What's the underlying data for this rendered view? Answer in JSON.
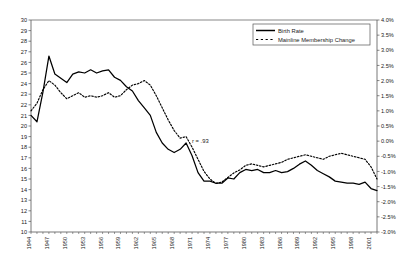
{
  "chart_data": {
    "type": "line",
    "title": "",
    "subtitle": "",
    "xlabel": "",
    "ylabel": "",
    "grid": false,
    "legend_position": "top-right",
    "annotations": [
      {
        "text": "r = .93",
        "x": 1971,
        "y_axis": "left",
        "y": 18.4
      }
    ],
    "axes": {
      "x": {
        "min": 1944,
        "max": 2002,
        "tick_step": 3,
        "minor_tick_step": 1,
        "tick_labels": [
          "1944",
          "1947",
          "1950",
          "1953",
          "1956",
          "1959",
          "1962",
          "1965",
          "1968",
          "1971",
          "1974",
          "1977",
          "1980",
          "1983",
          "1986",
          "1989",
          "1992",
          "1995",
          "1998",
          "2001"
        ],
        "label_orientation": "vertical"
      },
      "y_left": {
        "min": 10,
        "max": 30,
        "tick_step": 1,
        "tick_labels": [
          "10",
          "11",
          "12",
          "13",
          "14",
          "15",
          "16",
          "17",
          "18",
          "19",
          "20",
          "21",
          "22",
          "23",
          "24",
          "25",
          "26",
          "27",
          "28",
          "29",
          "30"
        ]
      },
      "y_right": {
        "min": -3.0,
        "max": 4.0,
        "tick_step": 0.5,
        "tick_labels": [
          "-3.0%",
          "-2.5%",
          "-2.0%",
          "-1.5%",
          "-1.0%",
          "-0.5%",
          "0.0%",
          "0.5%",
          "1.0%",
          "1.5%",
          "2.0%",
          "2.5%",
          "3.0%",
          "3.5%",
          "4.0%"
        ]
      }
    },
    "x": [
      1944,
      1945,
      1946,
      1947,
      1948,
      1949,
      1950,
      1951,
      1952,
      1953,
      1954,
      1955,
      1956,
      1957,
      1958,
      1959,
      1960,
      1961,
      1962,
      1963,
      1964,
      1965,
      1966,
      1967,
      1968,
      1969,
      1970,
      1971,
      1972,
      1973,
      1974,
      1975,
      1976,
      1977,
      1978,
      1979,
      1980,
      1981,
      1982,
      1983,
      1984,
      1985,
      1986,
      1987,
      1988,
      1989,
      1990,
      1991,
      1992,
      1993,
      1994,
      1995,
      1996,
      1997,
      1998,
      1999,
      2000,
      2001,
      2002
    ],
    "series": [
      {
        "name": "Birth Rate",
        "axis": "left",
        "style": "solid",
        "color": "#000000",
        "values": [
          21.0,
          20.4,
          23.2,
          26.6,
          24.9,
          24.5,
          24.1,
          24.9,
          25.1,
          25.0,
          25.3,
          25.0,
          25.2,
          25.3,
          24.6,
          24.3,
          23.7,
          23.3,
          22.4,
          21.7,
          21.0,
          19.4,
          18.4,
          17.8,
          17.5,
          17.8,
          18.4,
          17.2,
          15.6,
          14.8,
          14.8,
          14.6,
          14.6,
          15.1,
          15.0,
          15.6,
          15.9,
          15.8,
          15.9,
          15.6,
          15.6,
          15.8,
          15.6,
          15.7,
          16.0,
          16.4,
          16.7,
          16.3,
          15.8,
          15.5,
          15.2,
          14.8,
          14.7,
          14.6,
          14.6,
          14.5,
          14.7,
          14.1,
          13.9
        ]
      },
      {
        "name": "Mainline Membership Change",
        "axis": "right",
        "style": "dashed",
        "color": "#000000",
        "values": [
          1.0,
          1.25,
          1.7,
          2.0,
          1.85,
          1.6,
          1.4,
          1.5,
          1.6,
          1.45,
          1.5,
          1.45,
          1.5,
          1.6,
          1.45,
          1.5,
          1.7,
          1.85,
          1.9,
          2.0,
          1.85,
          1.5,
          1.1,
          0.7,
          0.35,
          0.1,
          0.15,
          -0.2,
          -0.6,
          -1.0,
          -1.25,
          -1.4,
          -1.35,
          -1.2,
          -1.05,
          -0.95,
          -0.8,
          -0.75,
          -0.8,
          -0.85,
          -0.8,
          -0.75,
          -0.7,
          -0.6,
          -0.55,
          -0.5,
          -0.45,
          -0.5,
          -0.55,
          -0.6,
          -0.5,
          -0.45,
          -0.4,
          -0.45,
          -0.5,
          -0.55,
          -0.6,
          -0.85,
          -1.25
        ]
      }
    ]
  },
  "legend": {
    "items": [
      {
        "label": "Birth Rate",
        "style": "solid"
      },
      {
        "label": "Mainline Membership Change",
        "style": "dashed"
      }
    ]
  }
}
